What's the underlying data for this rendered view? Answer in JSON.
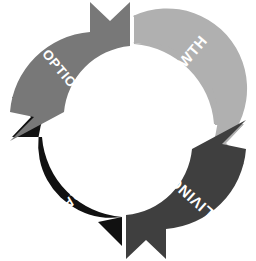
{
  "diagram": {
    "type": "cycle",
    "title": "",
    "background_color": "#ffffff",
    "direction": "counter-clockwise",
    "segment_count": 4,
    "center": {
      "x": 128,
      "y": 130
    },
    "outer_radius": 114,
    "inner_radius": 40,
    "label_text_color": "#ffffff",
    "segments": [
      {
        "id": "growth",
        "label": "GROWTH",
        "color": "#b0b0b0",
        "position": "top-right",
        "arrow_direction": "down-left",
        "label_rotation": -50
      },
      {
        "id": "living",
        "label": "LIVING",
        "color": "#3f3f3f",
        "position": "bottom-right",
        "arrow_direction": "down-right",
        "label_rotation": -138
      },
      {
        "id": "crap",
        "label": "CRAP",
        "color": "#111111",
        "position": "bottom-left",
        "arrow_direction": "up-left",
        "label_rotation": -230
      },
      {
        "id": "option3",
        "label": "OPTION 3",
        "color": "#787878",
        "position": "top-left",
        "arrow_direction": "up-right",
        "label_rotation": -310
      }
    ]
  }
}
